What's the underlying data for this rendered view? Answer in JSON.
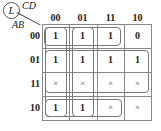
{
  "kmap": {
    "output": "L",
    "col_vars": "CD",
    "row_vars": "AB",
    "col_labels": [
      "00",
      "01",
      "11",
      "10"
    ],
    "row_labels": [
      "00",
      "01",
      "11",
      "10"
    ],
    "rows": [
      [
        "1",
        "1",
        "1",
        "0"
      ],
      [
        "1",
        "1",
        "1",
        "1"
      ],
      [
        "×",
        "×",
        "×",
        "×"
      ],
      [
        "1",
        "1",
        "×",
        "×"
      ]
    ]
  }
}
